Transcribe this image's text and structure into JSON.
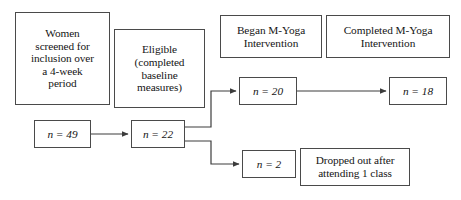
{
  "diagram": {
    "type": "flowchart",
    "canvas": {
      "width": 461,
      "height": 200
    },
    "colors": {
      "background": "#ffffff",
      "box_border": "#4a4a4a",
      "box_fill": "#ffffff",
      "connector": "#3c3c3c",
      "text": "#151515"
    },
    "boxes": {
      "screened": {
        "label": "Women\nscreened for\ninclusion over\na 4-week\nperiod"
      },
      "eligible": {
        "label": "Eligible\n(completed\nbaseline\nmeasures)"
      },
      "began_intervention": {
        "label": "Began M-Yoga\nIntervention"
      },
      "completed_intervention": {
        "label": "Completed M-Yoga\nIntervention"
      },
      "screened_count": {
        "label": "n = 49"
      },
      "eligible_count": {
        "label": "n = 22"
      },
      "began_count": {
        "label": "n = 20"
      },
      "completed_count": {
        "label": "n = 18"
      },
      "dropped_count": {
        "label": "n = 2"
      },
      "dropped_reason": {
        "label": "Dropped out after\nattending 1 class"
      }
    },
    "connectors": [
      {
        "name": "screened-to-eligible",
        "from": "screened_count",
        "to": "eligible_count",
        "style": "straight-arrow"
      },
      {
        "name": "eligible-to-began",
        "from": "eligible_count",
        "to": "began_count",
        "style": "elbow-up-arrow"
      },
      {
        "name": "eligible-to-dropped",
        "from": "eligible_count",
        "to": "dropped_count",
        "style": "elbow-down-arrow"
      },
      {
        "name": "began-to-completed",
        "from": "began_count",
        "to": "completed_count",
        "style": "straight-arrow"
      }
    ]
  }
}
